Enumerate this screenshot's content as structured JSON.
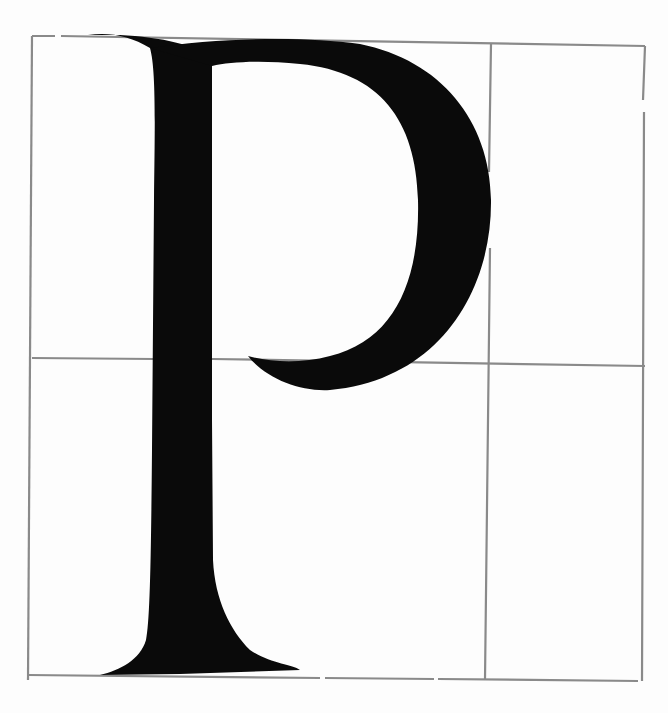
{
  "figure": {
    "letter": "P",
    "colors": {
      "background": "#fdfdfd",
      "ink": "#0a0a0a",
      "grid": "#8a8a8a"
    },
    "grid": {
      "outer": {
        "x1": 32,
        "y1": 36,
        "x2": 643,
        "y2": 682
      },
      "vertical_divider_x": 489,
      "horizontal_divider_y": 360
    }
  }
}
